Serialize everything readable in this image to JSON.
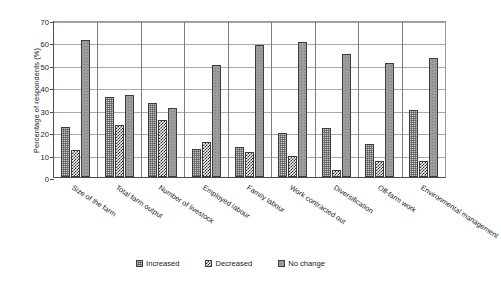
{
  "chart_data": {
    "type": "bar",
    "title": "",
    "subtitle": "",
    "xlabel": "",
    "ylabel": "Percentage of respondents (%)",
    "ylim": [
      0,
      70
    ],
    "ytick_step": 10,
    "yticks": [
      70,
      60,
      50,
      40,
      30,
      20,
      10,
      0
    ],
    "grid": "horizontal-and-group-separators",
    "legend_position": "bottom-center",
    "categories": [
      "Size of the farm",
      "Total farm output",
      "Number of livestock",
      "Employed labour",
      "Family labour",
      "Work contracted out",
      "Diversification",
      "Off-farm work",
      "Environmental management"
    ],
    "series": [
      {
        "name": "Increased",
        "pattern": "dark-grey-dotted",
        "values": [
          22.2,
          35.5,
          32.8,
          12.5,
          13.3,
          19.5,
          22.0,
          14.5,
          30.0
        ]
      },
      {
        "name": "Decreased",
        "pattern": "black-checkerboard",
        "values": [
          12.2,
          23.4,
          25.4,
          15.6,
          11.0,
          9.5,
          3.0,
          7.0,
          7.0
        ]
      },
      {
        "name": "No change",
        "pattern": "light-grey-dotted",
        "values": [
          61.0,
          36.4,
          30.6,
          50.0,
          59.0,
          60.2,
          55.0,
          51.0,
          53.0
        ]
      }
    ]
  },
  "legend": {
    "items": [
      {
        "label": "Increased"
      },
      {
        "label": "Decreased"
      },
      {
        "label": "No change"
      }
    ]
  },
  "colors": {
    "increased": "#808080",
    "decreased": "#2b2b2b",
    "no_change": "#9d9d9d",
    "axis": "#4d4d4d",
    "gridline": "#a8a8a8",
    "separator": "#7d7d7d",
    "text": "#1a1a1a",
    "background": "#ffffff"
  }
}
